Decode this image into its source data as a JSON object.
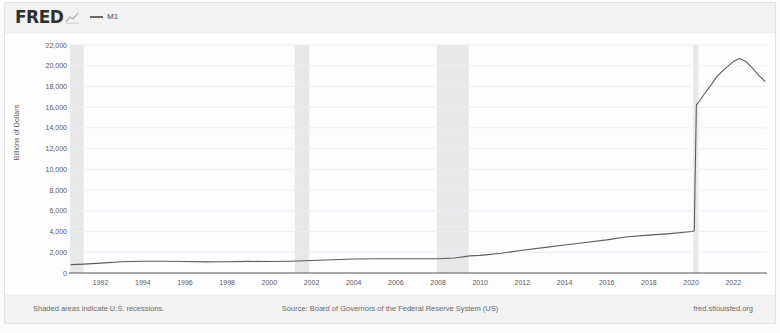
{
  "header": {
    "logo_text": "FRED",
    "logo_mark_icon": "fred-chart-mark-icon",
    "legend": [
      {
        "label": "M1",
        "color": "#6a6a6a",
        "swatch_icon": "line-swatch-icon"
      }
    ]
  },
  "footer": {
    "left_note": "Shaded areas indicate U.S. recessions.",
    "center_note": "Source: Board of Governors of the Federal Reserve System (US)",
    "right_note": "fred.stlouisfed.org"
  },
  "chart_data": {
    "type": "line",
    "title": "M1",
    "xlabel": "",
    "ylabel": "Billions of Dollars",
    "ylim": [
      0,
      22000
    ],
    "xlim": [
      1990.5,
      2023.6
    ],
    "grid": true,
    "legend_position": "top-left",
    "y_ticks": [
      "0",
      "2,000",
      "4,000",
      "6,000",
      "8,000",
      "10,000",
      "12,000",
      "14,000",
      "16,000",
      "18,000",
      "20,000",
      "22,000"
    ],
    "y_tick_values": [
      0,
      2000,
      4000,
      6000,
      8000,
      10000,
      12000,
      14000,
      16000,
      18000,
      20000,
      22000
    ],
    "x_ticks": [
      "1992",
      "1994",
      "1996",
      "1998",
      "2000",
      "2002",
      "2004",
      "2006",
      "2008",
      "2010",
      "2012",
      "2014",
      "2016",
      "2018",
      "2020",
      "2022"
    ],
    "x_tick_values": [
      1992,
      1994,
      1996,
      1998,
      2000,
      2002,
      2004,
      2006,
      2008,
      2010,
      2012,
      2014,
      2016,
      2018,
      2020,
      2022
    ],
    "line_color": "#5c5c5c",
    "recession_color": "#e8e8e8",
    "recession_bands": [
      {
        "start": 1990.55,
        "end": 1991.2,
        "label": "1990-91 recession"
      },
      {
        "start": 2001.2,
        "end": 2001.9,
        "label": "2001 recession"
      },
      {
        "start": 2007.95,
        "end": 2009.45,
        "label": "2008-09 recession"
      },
      {
        "start": 2020.1,
        "end": 2020.35,
        "label": "2020 recession"
      }
    ],
    "series": [
      {
        "name": "M1",
        "color": "#5c5c5c",
        "x": [
          1990.6,
          1991.2,
          1992.0,
          1993.0,
          1994.0,
          1995.0,
          1996.0,
          1997.0,
          1998.0,
          1999.0,
          2000.0,
          2001.0,
          2002.0,
          2003.0,
          2004.0,
          2005.0,
          2006.0,
          2007.0,
          2008.0,
          2008.8,
          2009.5,
          2010.0,
          2011.0,
          2012.0,
          2013.0,
          2014.0,
          2015.0,
          2016.0,
          2017.0,
          2018.0,
          2019.0,
          2019.8,
          2020.05,
          2020.15,
          2020.25,
          2020.4,
          2020.6,
          2020.9,
          2021.2,
          2021.6,
          2022.0,
          2022.3,
          2022.6,
          2022.9,
          2023.2,
          2023.5
        ],
        "y": [
          810,
          860,
          950,
          1080,
          1140,
          1140,
          1110,
          1075,
          1090,
          1120,
          1110,
          1140,
          1200,
          1280,
          1350,
          1375,
          1375,
          1370,
          1380,
          1450,
          1650,
          1700,
          1900,
          2200,
          2450,
          2700,
          2950,
          3200,
          3500,
          3650,
          3800,
          3950,
          4000,
          4050,
          16200,
          16600,
          17200,
          18000,
          18900,
          19700,
          20400,
          20700,
          20400,
          19800,
          19100,
          18500
        ]
      }
    ]
  }
}
